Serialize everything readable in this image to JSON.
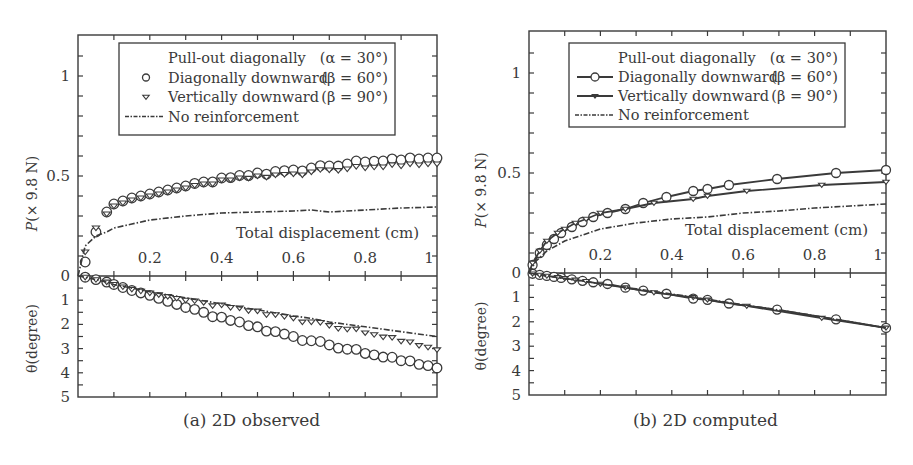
{
  "figure": {
    "captions": [
      "(a) 2D observed",
      "(b) 2D computed"
    ]
  },
  "chart_data": [
    {
      "type": "line",
      "title": "(a) 2D observed",
      "xlabel": "Total displacement (cm)",
      "ylabel_top": "P(× 9.8 N)",
      "ylabel_bottom": "θ(degree)",
      "xlim": [
        0,
        1.0
      ],
      "ylim_top": [
        0,
        1.2
      ],
      "ylim_bottom": [
        0,
        5
      ],
      "x_ticks": [
        "0.2",
        "0.4",
        "0.6",
        "0.8",
        "1"
      ],
      "y_ticks_top": [
        "0",
        "0.5",
        "1"
      ],
      "y_ticks_bottom": [
        "1",
        "2",
        "3",
        "4",
        "5"
      ],
      "legend": {
        "position": "upper center",
        "entries": [
          {
            "label": "Pull-out diagonally",
            "param": "(α = 30°)",
            "marker": "none"
          },
          {
            "label": "Diagonally downward",
            "param": "(β = 60°)",
            "marker": "circle"
          },
          {
            "label": "Vertically downward",
            "param": "(β = 90°)",
            "marker": "triangle-down"
          },
          {
            "label": "No reinforcement",
            "param": "",
            "marker": "dash-dot"
          }
        ]
      },
      "series": [
        {
          "name": "Diagonally downward (β = 60°)",
          "style": "circles",
          "x": [
            0.0,
            0.02,
            0.05,
            0.08,
            0.1,
            0.15,
            0.2,
            0.25,
            0.3,
            0.4,
            0.5,
            0.6,
            0.7,
            0.8,
            0.9,
            1.0
          ],
          "P": [
            0.0,
            0.07,
            0.22,
            0.32,
            0.36,
            0.39,
            0.41,
            0.43,
            0.45,
            0.49,
            0.515,
            0.53,
            0.55,
            0.57,
            0.58,
            0.59
          ],
          "theta": [
            0.0,
            0.05,
            0.15,
            0.25,
            0.35,
            0.6,
            0.8,
            1.05,
            1.3,
            1.7,
            2.1,
            2.5,
            2.85,
            3.2,
            3.5,
            3.8
          ]
        },
        {
          "name": "Vertically downward (β = 90°)",
          "style": "triangles",
          "x": [
            0.0,
            0.02,
            0.05,
            0.08,
            0.1,
            0.15,
            0.2,
            0.25,
            0.3,
            0.4,
            0.5,
            0.6,
            0.7,
            0.8,
            0.9,
            1.0
          ],
          "P": [
            0.0,
            0.12,
            0.24,
            0.31,
            0.35,
            0.38,
            0.4,
            0.42,
            0.44,
            0.48,
            0.5,
            0.51,
            0.53,
            0.54,
            0.55,
            0.56
          ],
          "theta": [
            0.0,
            0.05,
            0.15,
            0.25,
            0.35,
            0.55,
            0.7,
            0.85,
            1.0,
            1.2,
            1.45,
            1.75,
            2.05,
            2.35,
            2.7,
            3.05
          ]
        },
        {
          "name": "No reinforcement",
          "style": "dashdot",
          "x": [
            0.0,
            0.02,
            0.05,
            0.08,
            0.1,
            0.15,
            0.2,
            0.3,
            0.4,
            0.5,
            0.6,
            0.65,
            0.7,
            0.8,
            0.9,
            1.0
          ],
          "P": [
            0.0,
            0.15,
            0.2,
            0.22,
            0.24,
            0.26,
            0.28,
            0.3,
            0.315,
            0.32,
            0.325,
            0.33,
            0.32,
            0.33,
            0.34,
            0.345
          ],
          "theta": [
            0.0,
            0.05,
            0.15,
            0.25,
            0.35,
            0.5,
            0.65,
            0.9,
            1.15,
            1.4,
            1.65,
            1.75,
            1.9,
            2.1,
            2.3,
            2.5
          ]
        }
      ]
    },
    {
      "type": "line",
      "title": "(b) 2D computed",
      "xlabel": "Total displacement (cm)",
      "ylabel_top": "P(× 9.8 N)",
      "ylabel_bottom": "θ(degree)",
      "xlim": [
        0,
        1.0
      ],
      "ylim_top": [
        0,
        1.2
      ],
      "ylim_bottom": [
        0,
        5
      ],
      "x_ticks": [
        "0.2",
        "0.4",
        "0.6",
        "0.8",
        "1"
      ],
      "y_ticks_top": [
        "0",
        "0.5",
        "1"
      ],
      "y_ticks_bottom": [
        "1",
        "2",
        "3",
        "4",
        "5"
      ],
      "legend": {
        "position": "upper center",
        "entries": [
          {
            "label": "Pull-out diagonally",
            "param": "(α = 30°)",
            "marker": "none"
          },
          {
            "label": "Diagonally downward",
            "param": "(β = 60°)",
            "marker": "line-circle"
          },
          {
            "label": "Vertically downward",
            "param": "(β = 90°)",
            "marker": "line-triangle-down"
          },
          {
            "label": "No reinforcement",
            "param": "",
            "marker": "dash-dot"
          }
        ]
      },
      "series": [
        {
          "name": "Diagonally downward (β = 60°)",
          "style": "line-circles",
          "x": [
            0.0,
            0.01,
            0.03,
            0.05,
            0.07,
            0.09,
            0.12,
            0.15,
            0.18,
            0.22,
            0.27,
            0.32,
            0.385,
            0.46,
            0.5,
            0.56,
            0.695,
            0.86,
            1.0
          ],
          "P": [
            0.0,
            0.04,
            0.1,
            0.14,
            0.17,
            0.2,
            0.23,
            0.255,
            0.28,
            0.3,
            0.32,
            0.35,
            0.38,
            0.41,
            0.42,
            0.44,
            0.47,
            0.5,
            0.515
          ],
          "theta": [
            0.0,
            0.03,
            0.08,
            0.12,
            0.16,
            0.2,
            0.26,
            0.32,
            0.38,
            0.45,
            0.6,
            0.72,
            0.85,
            1.05,
            1.1,
            1.25,
            1.5,
            1.9,
            2.25
          ]
        },
        {
          "name": "Vertically downward (β = 90°)",
          "style": "line-triangles",
          "x": [
            0.0,
            0.01,
            0.03,
            0.05,
            0.08,
            0.1,
            0.13,
            0.16,
            0.2,
            0.27,
            0.35,
            0.46,
            0.5,
            0.61,
            0.82,
            1.0
          ],
          "P": [
            0.0,
            0.05,
            0.11,
            0.16,
            0.2,
            0.22,
            0.25,
            0.27,
            0.3,
            0.32,
            0.35,
            0.37,
            0.385,
            0.41,
            0.44,
            0.455
          ],
          "theta": [
            0.0,
            0.03,
            0.08,
            0.12,
            0.18,
            0.22,
            0.28,
            0.34,
            0.45,
            0.6,
            0.8,
            1.0,
            1.1,
            1.35,
            1.85,
            2.25
          ]
        },
        {
          "name": "No reinforcement",
          "style": "dashdot",
          "x": [
            0.0,
            0.02,
            0.05,
            0.1,
            0.15,
            0.2,
            0.3,
            0.4,
            0.5,
            0.6,
            0.7,
            0.8,
            0.9,
            1.0
          ],
          "P": [
            0.0,
            0.06,
            0.11,
            0.16,
            0.19,
            0.22,
            0.25,
            0.27,
            0.28,
            0.3,
            0.31,
            0.325,
            0.335,
            0.345
          ],
          "theta": [
            0.0,
            0.05,
            0.12,
            0.23,
            0.33,
            0.44,
            0.65,
            0.86,
            1.08,
            1.3,
            1.52,
            1.75,
            2.0,
            2.25
          ]
        }
      ]
    }
  ]
}
